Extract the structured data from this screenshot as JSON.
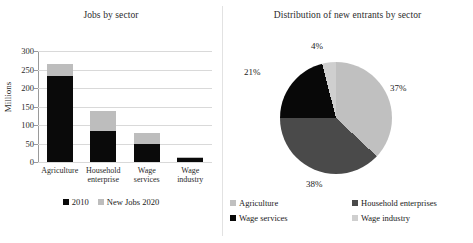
{
  "chart_data": [
    {
      "type": "bar",
      "title": "Jobs by sector",
      "xlabel": "",
      "ylabel": "Millions",
      "ylim": [
        0,
        300
      ],
      "yticks": [
        "300",
        "250",
        "200",
        "150",
        "100",
        "50",
        "0"
      ],
      "grid": true,
      "stacked": true,
      "legend_position": "bottom",
      "categories": [
        "Agriculture",
        "Household enterprise",
        "Wage services",
        "Wage industry"
      ],
      "category_lines": [
        [
          "Agriculture"
        ],
        [
          "Household",
          "enterprise"
        ],
        [
          "Wage",
          "services"
        ],
        [
          "Wage",
          "industry"
        ]
      ],
      "series": [
        {
          "name": "2010",
          "color": "#0a0a0a",
          "values": [
            233,
            84,
            48,
            10
          ]
        },
        {
          "name": "New Jobs 2020",
          "color": "#bdbdbd",
          "values": [
            33,
            53,
            31,
            3
          ]
        }
      ],
      "totals": [
        266,
        137,
        79,
        13
      ]
    },
    {
      "type": "pie",
      "title": "Distribution of new entrants by sector",
      "legend_position": "bottom",
      "labels": [
        "Agriculture",
        "Household enterprises",
        "Wage services",
        "Wage industry"
      ],
      "values": [
        37,
        38,
        21,
        4
      ],
      "value_labels": [
        "37%",
        "38%",
        "21%",
        "4%"
      ],
      "colors": [
        "#c0c0c0",
        "#4a4a4a",
        "#080808",
        "#cfcfcf"
      ],
      "start_angle_deg": 0
    }
  ],
  "bar_chart": {
    "title": "Jobs by sector",
    "y_axis_title": "Millions",
    "y_ticks": [
      {
        "label": "300",
        "value": 300
      },
      {
        "label": "250",
        "value": 250
      },
      {
        "label": "200",
        "value": 200
      },
      {
        "label": "150",
        "value": 150
      },
      {
        "label": "100",
        "value": 100
      },
      {
        "label": "50",
        "value": 50
      },
      {
        "label": "0",
        "value": 0
      }
    ],
    "bars": [
      {
        "line1": "Agriculture",
        "line2": "",
        "v2010": 233,
        "vnew": 33
      },
      {
        "line1": "Household",
        "line2": "enterprise",
        "v2010": 84,
        "vnew": 53
      },
      {
        "line1": "Wage",
        "line2": "services",
        "v2010": 48,
        "vnew": 31
      },
      {
        "line1": "Wage",
        "line2": "industry",
        "v2010": 10,
        "vnew": 3
      }
    ],
    "legend": [
      {
        "label": "2010",
        "color": "#0a0a0a"
      },
      {
        "label": "New Jobs 2020",
        "color": "#bdbdbd"
      }
    ]
  },
  "pie_chart": {
    "title": "Distribution of new entrants by sector",
    "slice_labels": {
      "agriculture": "37%",
      "household": "38%",
      "wage_services": "21%",
      "wage_industry": "4%"
    },
    "legend": [
      {
        "label": "Agriculture",
        "color": "#c0c0c0"
      },
      {
        "label": "Household enterprises",
        "color": "#4a4a4a"
      },
      {
        "label": "Wage services",
        "color": "#080808"
      },
      {
        "label": "Wage industry",
        "color": "#cfcfcf"
      }
    ]
  }
}
